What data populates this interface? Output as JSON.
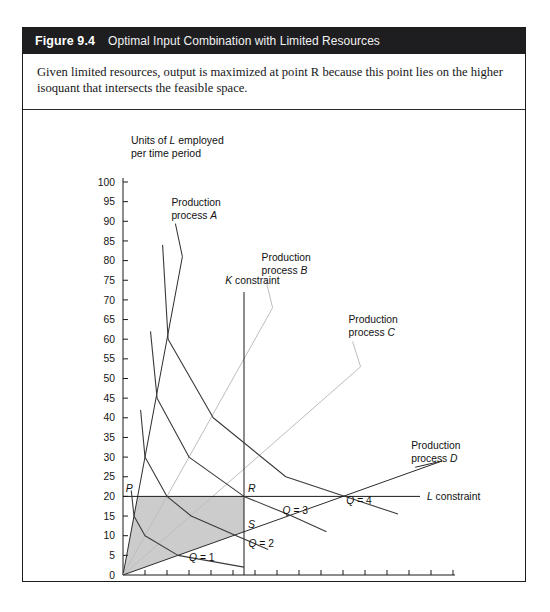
{
  "figure": {
    "number": "Figure 9.4",
    "title": "Optimal Input Combination with Limited Resources",
    "caption": "Given limited resources, output is maximized at point R because this point lies on the higher isoquant that intersects the feasible space."
  },
  "colors": {
    "header_bg": "#1e1e20",
    "header_text": "#ffffff",
    "border": "#1c1c1c",
    "axis": "#1a1a1a",
    "curve": "#3a3a3a",
    "ray_dark": "#2b2b2b",
    "ray_light": "#bdbdbd",
    "feasible_fill": "#c9c9c9"
  },
  "chart_data": {
    "type": "line",
    "title": "Optimal Input Combination with Limited Resources",
    "xlabel": "Units of K employed per time period",
    "ylabel": "Units of L employed per time period",
    "xlim": [
      0,
      30
    ],
    "ylim": [
      0,
      100
    ],
    "xticks": [
      0,
      2,
      4,
      6,
      8,
      10,
      12,
      14,
      16,
      18,
      20,
      22,
      24,
      26,
      28,
      30
    ],
    "yticks": [
      0,
      5,
      10,
      15,
      20,
      25,
      30,
      35,
      40,
      45,
      50,
      55,
      60,
      65,
      70,
      75,
      80,
      85,
      90,
      95,
      100
    ],
    "grid": false,
    "legend": "inline-annotations",
    "constraints": [
      {
        "name": "K constraint",
        "type": "vertical",
        "value": 11,
        "label": "K constraint",
        "y_top": 72,
        "y_bottom": 0
      },
      {
        "name": "L constraint",
        "type": "horizontal",
        "value": 20,
        "label": "L constraint",
        "x_left": 0,
        "x_right": 27
      }
    ],
    "process_rays": [
      {
        "name": "Production process A",
        "label_line1": "Production",
        "label_line2": "process A",
        "slope_L_per_K": 15.0,
        "x_end": 5.4,
        "y_end": 81,
        "color": "dark"
      },
      {
        "name": "Production process B",
        "label_line1": "Production",
        "label_line2": "process B",
        "slope_L_per_K": 5.0,
        "x_end": 13.6,
        "y_end": 68,
        "color": "light"
      },
      {
        "name": "Production process C",
        "label_line1": "Production",
        "label_line2": "process C",
        "slope_L_per_K": 2.45,
        "x_end": 21.6,
        "y_end": 53,
        "color": "light"
      },
      {
        "name": "Production process D",
        "label_line1": "Production",
        "label_line2": "process D",
        "slope_L_per_K": 1.0,
        "x_end": 29.0,
        "y_end": 29,
        "color": "dark"
      }
    ],
    "isoquants": [
      {
        "label": "Q = 1",
        "vertices": [
          [
            0.75,
            21.5
          ],
          [
            1.0,
            15.0
          ],
          [
            2.0,
            10.0
          ],
          [
            5.0,
            5.0
          ],
          [
            11.0,
            2.0
          ]
        ],
        "label_x": 6.0,
        "label_y": 3.5
      },
      {
        "label": "Q = 2",
        "vertices": [
          [
            1.6,
            42.0
          ],
          [
            2.0,
            30.0
          ],
          [
            4.0,
            20.0
          ],
          [
            6.2,
            15.0
          ],
          [
            10.3,
            10.0
          ],
          [
            13.2,
            6.5
          ]
        ],
        "label_x": 11.4,
        "label_y": 7.0
      },
      {
        "label": "Q = 3",
        "vertices": [
          [
            2.5,
            62.0
          ],
          [
            3.1,
            45.0
          ],
          [
            6.0,
            30.0
          ],
          [
            11.0,
            20.0
          ],
          [
            15.2,
            15.2
          ],
          [
            18.5,
            11.0
          ]
        ],
        "label_x": 14.5,
        "label_y": 15.5
      },
      {
        "label": "Q = 4",
        "vertices": [
          [
            3.6,
            84.0
          ],
          [
            4.1,
            60.0
          ],
          [
            8.2,
            40.0
          ],
          [
            14.8,
            25.0
          ],
          [
            20.2,
            20.0
          ],
          [
            25.0,
            15.5
          ]
        ],
        "label_x": 20.3,
        "label_y": 18.0
      }
    ],
    "feasible_region": {
      "description": "shaded region bounded by process A ray, L constraint (L=20), K constraint (K=11), and process D ray",
      "vertices": [
        [
          0,
          0
        ],
        [
          1.33,
          20.0
        ],
        [
          11.0,
          20.0
        ],
        [
          11.0,
          11.0
        ]
      ],
      "fill": "#c9c9c9"
    },
    "points": [
      {
        "label": "P",
        "x": 1.33,
        "y": 20.0
      },
      {
        "label": "R",
        "x": 11.0,
        "y": 20.0
      },
      {
        "label": "S",
        "x": 11.0,
        "y": 13.0
      }
    ],
    "annotations": [
      {
        "text": "Production process A",
        "x": 4.4,
        "y": 94
      },
      {
        "text": "Production process B",
        "x": 12.6,
        "y": 80
      },
      {
        "text": "Production process C",
        "x": 20.5,
        "y": 64
      },
      {
        "text": "Production process D",
        "x": 26.2,
        "y": 32
      },
      {
        "text": "K constraint",
        "x": 9.3,
        "y": 74
      },
      {
        "text": "L constraint",
        "x": 28.0,
        "y": 20
      }
    ]
  }
}
